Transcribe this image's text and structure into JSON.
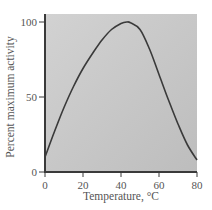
{
  "chart_data": {
    "type": "line",
    "title": "",
    "xlabel": "Temperature, °C",
    "ylabel": "Percent maximum activity",
    "xlim": [
      0,
      80
    ],
    "ylim": [
      0,
      100
    ],
    "xticks": [
      0,
      20,
      40,
      60,
      80
    ],
    "yticks": [
      0,
      50,
      100
    ],
    "xtick_labels": [
      "0",
      "20",
      "40",
      "60",
      "80"
    ],
    "ytick_labels": [
      "0",
      "50",
      "100"
    ],
    "grid": false,
    "legend": null,
    "series": [
      {
        "name": "Enzyme activity",
        "x": [
          0,
          5,
          10,
          15,
          20,
          25,
          30,
          35,
          40,
          43,
          45,
          50,
          55,
          60,
          65,
          70,
          75,
          80
        ],
        "values": [
          10,
          27,
          43,
          57,
          69,
          79,
          88,
          95,
          99,
          100,
          99.5,
          95,
          82,
          65,
          48,
          32,
          18,
          8
        ]
      }
    ],
    "colors": {
      "plot_background": "#c4c4c4",
      "line": "#3a3a3a",
      "axis": "#3a3a3a",
      "text": "#555555"
    }
  }
}
